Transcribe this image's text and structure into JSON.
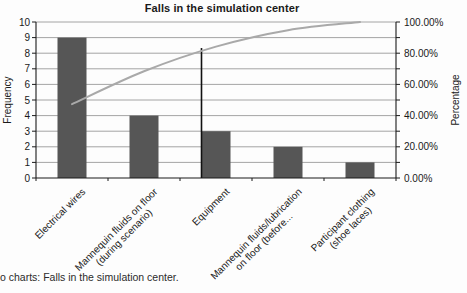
{
  "title": "Falls in the simulation center",
  "caption": "o charts: Falls in the simulation center.",
  "chart_data": {
    "type": "bar",
    "subtype": "pareto (bars + cumulative percentage line)",
    "title": "Falls in the simulation center",
    "categories": [
      "Electrical wires",
      "Mannequin fluids on floor\n(during scenario)",
      "Equipment",
      "Mannequin fluids/lubrication\non floor (before...",
      "Participant clothing\n(shoe laces)"
    ],
    "series": [
      {
        "name": "Frequency",
        "type": "bar",
        "values": [
          9,
          4,
          3,
          2,
          1
        ]
      },
      {
        "name": "Cumulative percentage",
        "type": "line",
        "values": [
          47.37,
          68.42,
          84.21,
          94.74,
          100.0
        ]
      }
    ],
    "left_axis": {
      "label": "Frequency",
      "min": 0,
      "max": 10,
      "ticks": [
        "0",
        "1",
        "2",
        "3",
        "4",
        "5",
        "6",
        "7",
        "8",
        "9",
        "10"
      ]
    },
    "right_axis": {
      "label": "Percentage",
      "min": 0,
      "max": 100,
      "ticks": [
        "0.00%",
        "20.00%",
        "40.00%",
        "60.00%",
        "80.00%",
        "100.00%"
      ]
    },
    "gridlines": "horizontal at every frequency unit (every 10%)",
    "legend": "none",
    "cutoff_line": {
      "category_index": 2,
      "top_percent": 83.3
    },
    "colors": {
      "bar": "#565656",
      "cumulative_line": "#a9a9a9",
      "gridline": "#9a9a9a",
      "axis": "#1a1a1a",
      "cutoff": "#111111",
      "text": "#1a1a1a"
    }
  }
}
